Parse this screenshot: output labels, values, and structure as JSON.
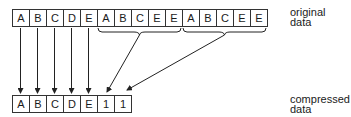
{
  "diagram": {
    "original": {
      "label_line1": "original",
      "label_line2": "data",
      "cells": [
        "A",
        "B",
        "C",
        "D",
        "E",
        "A",
        "B",
        "C",
        "E",
        "E",
        "A",
        "B",
        "C",
        "E",
        "E"
      ]
    },
    "compressed": {
      "label_line1": "compressed",
      "label_line2": "data",
      "cells": [
        "A",
        "B",
        "C",
        "D",
        "E",
        "1",
        "1"
      ]
    },
    "mappings": [
      {
        "from": "original.0",
        "to": "compressed.0"
      },
      {
        "from": "original.1",
        "to": "compressed.1"
      },
      {
        "from": "original.2",
        "to": "compressed.2"
      },
      {
        "from": "original.3",
        "to": "compressed.3"
      },
      {
        "from": "original.4",
        "to": "compressed.4"
      },
      {
        "from": "original.5-9",
        "to": "compressed.5"
      },
      {
        "from": "original.10-14",
        "to": "compressed.6"
      }
    ],
    "colors": {
      "line": "#333333",
      "text": "#1a1a1a",
      "background": "#ffffff"
    }
  }
}
